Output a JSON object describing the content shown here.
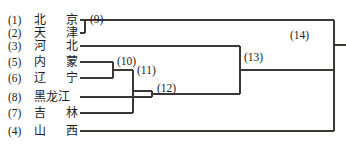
{
  "figure": {
    "type": "dendrogram",
    "orientation": "left-to-right",
    "line_color": "#3a3734",
    "text_color": "#201d1c",
    "background": "#ffffff"
  },
  "leaves": [
    {
      "index": "(1)",
      "name": "北 京",
      "chars": [
        "北",
        "京"
      ],
      "row": 0,
      "y": 20
    },
    {
      "index": "(2)",
      "name": "天 津",
      "chars": [
        "天",
        "津"
      ],
      "row": 1,
      "y": 33
    },
    {
      "index": "(3)",
      "name": "河 北",
      "chars": [
        "河",
        "北"
      ],
      "row": 2,
      "y": 46
    },
    {
      "index": "(5)",
      "name": "内 蒙",
      "chars": [
        "内",
        "蒙"
      ],
      "row": 3,
      "y": 62
    },
    {
      "index": "(6)",
      "name": "辽 宁",
      "chars": [
        "辽",
        "宁"
      ],
      "row": 4,
      "y": 78
    },
    {
      "index": "(8)",
      "name": "黑龙江",
      "chars": [
        "黑",
        "龙",
        "江"
      ],
      "row": 5,
      "y": 97
    },
    {
      "index": "(7)",
      "name": "吉 林",
      "chars": [
        "吉",
        "林"
      ],
      "row": 6,
      "y": 113
    },
    {
      "index": "(4)",
      "name": "山 西",
      "chars": [
        "山",
        "西"
      ],
      "row": 7,
      "y": 131
    }
  ],
  "nodes": [
    {
      "id": "(9)",
      "label": "(9)",
      "x": 85,
      "label_x": 90,
      "label_y": 13,
      "merge_of": [
        "(1)",
        "(2)"
      ]
    },
    {
      "id": "(10)",
      "label": "(10)",
      "x": 113,
      "label_x": 117,
      "label_y": 55,
      "merge_of": [
        "(5)",
        "(6)"
      ]
    },
    {
      "id": "(11)",
      "label": "(11)",
      "x": 133,
      "label_x": 137,
      "label_y": 64,
      "merge_of": [
        "(10)",
        "(7)"
      ]
    },
    {
      "id": "(12)",
      "label": "(12)",
      "x": 152,
      "label_x": 157,
      "label_y": 82,
      "merge_of": [
        "(11)",
        "(8)"
      ]
    },
    {
      "id": "(13)",
      "label": "(13)",
      "x": 240,
      "label_x": 244,
      "label_y": 51,
      "merge_of": [
        "(3)",
        "(12)"
      ]
    },
    {
      "id": "(14)",
      "label": "(14)",
      "x": 334,
      "label_x": 290,
      "label_y": 29,
      "merge_of": [
        "(9)",
        "(13)",
        "(4)"
      ]
    }
  ],
  "edges": {
    "leaf_start_x": 80,
    "trunk_top_y": 20,
    "root_x": 334,
    "root_stem_end_x": 346
  }
}
